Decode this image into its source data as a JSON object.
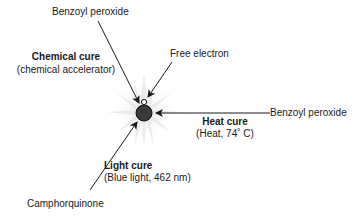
{
  "diagram": {
    "center": {
      "label": "Free electron"
    },
    "chemical": {
      "source": "Benzoyl peroxide",
      "title": "Chemical cure",
      "subtitle": "(chemical accelerator)"
    },
    "heat": {
      "source": "Benzoyl peroxide",
      "title": "Heat cure",
      "subtitle": "(Heat, 74˚ C)"
    },
    "light": {
      "source": "Camphorquinone",
      "title": "Light cure",
      "subtitle": "(Blue light, 462 nm)"
    }
  }
}
